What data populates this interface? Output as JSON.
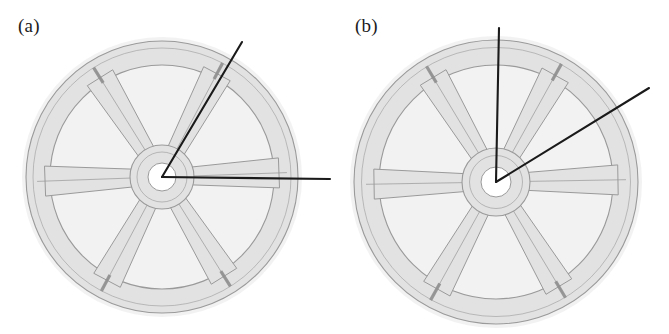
{
  "figure": {
    "background_color": "#ffffff",
    "width": 669,
    "height": 334,
    "caption_style": "lowercase-parenthesized"
  },
  "panels": [
    {
      "id": "panel-a",
      "label": "(a)",
      "subject": "six-spoke cast wheel, photographic line drawing",
      "wheel": {
        "center": {
          "x": 162,
          "y": 177
        },
        "outer_radius": 140,
        "rim_outer_radius": 136,
        "rim_inner_radius": 112,
        "hub_outer_radius": 32,
        "hub_bore_radius": 14,
        "spoke_count": 6,
        "spoke_angles_deg": [
          0,
          60,
          120,
          180,
          240,
          300
        ],
        "rotation_deg": 2,
        "fill_color": "#e2e2e2",
        "outline_color": "#9a9a9a",
        "halo_color": "#f0f0f0",
        "crack_color": "#8f8f8f",
        "crack_spoke_angles_deg": [
          60,
          120,
          240,
          300
        ]
      },
      "pointer_lines": [
        {
          "name": "angled-pointer",
          "from": {
            "x": 162,
            "y": 177
          },
          "to": {
            "x": 242,
            "y": 42
          },
          "angle_deg": 59,
          "color": "#1a1a1a",
          "width": 2.1
        },
        {
          "name": "horizontal-pointer",
          "from": {
            "x": 162,
            "y": 177
          },
          "to": {
            "x": 330,
            "y": 179
          },
          "angle_deg": 0,
          "color": "#1a1a1a",
          "width": 2.1
        }
      ]
    },
    {
      "id": "panel-b",
      "label": "(b)",
      "subject": "six-spoke cast wheel, photographic line drawing",
      "wheel": {
        "center": {
          "x": 161,
          "y": 182
        },
        "outer_radius": 146,
        "rim_outer_radius": 142,
        "rim_inner_radius": 117,
        "hub_outer_radius": 34,
        "hub_bore_radius": 15,
        "spoke_count": 6,
        "spoke_angles_deg": [
          0,
          60,
          120,
          180,
          240,
          300
        ],
        "rotation_deg": 1,
        "fill_color": "#e2e2e2",
        "outline_color": "#9a9a9a",
        "halo_color": "#f0f0f0",
        "crack_color": "#8f8f8f",
        "crack_spoke_angles_deg": [
          60,
          120,
          240,
          300
        ]
      },
      "pointer_lines": [
        {
          "name": "vertical-pointer",
          "from": {
            "x": 161,
            "y": 182
          },
          "to": {
            "x": 164,
            "y": 28
          },
          "angle_deg": 89,
          "color": "#1a1a1a",
          "width": 2.1
        },
        {
          "name": "diagonal-pointer",
          "from": {
            "x": 161,
            "y": 182
          },
          "to": {
            "x": 314,
            "y": 88
          },
          "angle_deg": 31,
          "color": "#1a1a1a",
          "width": 2.1
        }
      ]
    }
  ]
}
